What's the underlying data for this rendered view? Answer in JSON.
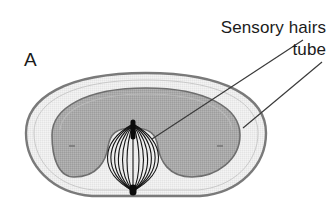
{
  "figure": {
    "panel_letter": "A",
    "background_color": "#ffffff",
    "annotations": [
      {
        "id": "sensory-hairs",
        "text": "Sensory hairs",
        "text_anchor_x": 326,
        "text_y": 33,
        "leader": {
          "x1": 303,
          "y1": 40,
          "x2": 152,
          "y2": 139
        }
      },
      {
        "id": "tube",
        "text": "tube",
        "text_anchor_x": 326,
        "text_y": 55,
        "leader": {
          "x1": 322,
          "y1": 62,
          "x2": 243,
          "y2": 128
        }
      }
    ],
    "structures": {
      "outer_tube": {
        "name": "tube",
        "cx": 146,
        "cy": 135,
        "rx": 120,
        "ry": 63,
        "fill": "#ececec",
        "stroke": "#7a7a7a",
        "stroke_width": 2.4
      },
      "inner_cavity": {
        "name": "sensory-epithelium",
        "fill": "#a9a9a9",
        "stroke": "#6e6e6e",
        "stroke_width": 1.6
      },
      "hair_bundle": {
        "name": "sensory-hairs",
        "count": 13,
        "apex_x": 133,
        "apex_y": 124,
        "base_x": 133,
        "base_y": 191,
        "max_half_width": 32,
        "stroke": "#141414",
        "stroke_width": 1.1
      }
    },
    "colors": {
      "ink": "#1b1b1b",
      "outer_ring": "#7a7a7a",
      "light_band": "#ececec",
      "inner_gray": "#a9a9a9",
      "inner_outline": "#6e6e6e",
      "hair_line": "#141414",
      "leader_line": "#3a3a3a"
    }
  }
}
